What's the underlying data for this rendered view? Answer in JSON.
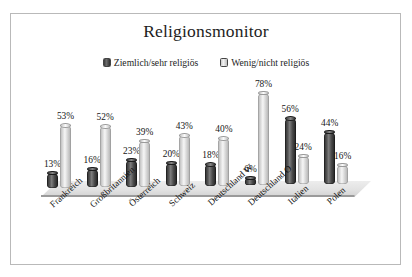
{
  "chart_data": {
    "type": "bar",
    "title": "Religionsmonitor",
    "xlabel": "",
    "ylabel": "",
    "ylim": [
      0,
      100
    ],
    "grid": false,
    "legend_position": "top-center",
    "value_suffix": "%",
    "categories": [
      "Frankreich",
      "Großbritannien",
      "Österreich",
      "Schweiz",
      "Deutschland W",
      "Deutschland O",
      "Italien",
      "Polen"
    ],
    "series": [
      {
        "name": "Ziemlich/sehr religiös",
        "key": "dark",
        "color": "#4a4a4a",
        "values": [
          13,
          16,
          23,
          20,
          18,
          6,
          56,
          44
        ],
        "labels": [
          "13%",
          "16%",
          "23%",
          "20%",
          "18%",
          "6%",
          "56%",
          "44%"
        ]
      },
      {
        "name": "Wenig/nicht religiös",
        "key": "light",
        "color": "#dcdcdc",
        "values": [
          53,
          52,
          39,
          43,
          40,
          78,
          24,
          16
        ],
        "labels": [
          "53%",
          "52%",
          "39%",
          "43%",
          "40%",
          "78%",
          "24%",
          "16%"
        ]
      }
    ]
  },
  "legend": {
    "items": [
      {
        "label": "Ziemlich/sehr religiös",
        "key": "dark"
      },
      {
        "label": "Wenig/nicht religiös",
        "key": "light"
      }
    ]
  },
  "colors": {
    "frame_border": "#b9b9b9",
    "background": "#ffffff",
    "text": "#1d1d1d",
    "floor": "#e2e2e2"
  }
}
